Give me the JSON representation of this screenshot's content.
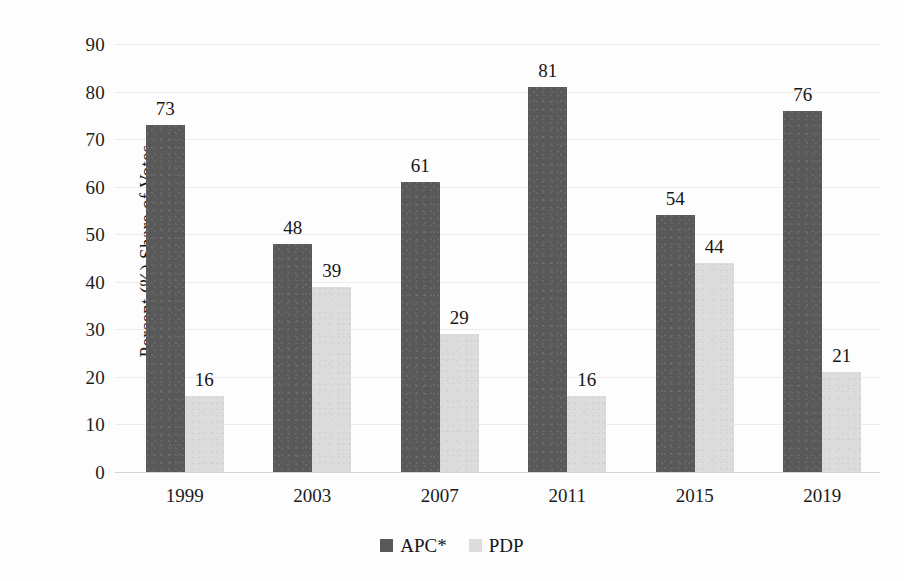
{
  "chart_data": {
    "type": "bar",
    "title": "",
    "xlabel": "",
    "ylabel": "Percent (%) Share of Votes",
    "ylim": [
      0,
      90
    ],
    "ytick_step": 10,
    "yticks": [
      "90",
      "80",
      "70",
      "60",
      "50",
      "40",
      "30",
      "20",
      "10",
      "0"
    ],
    "grid": true,
    "grid_axis": "y",
    "legend_position": "bottom-center",
    "categories": [
      "1999",
      "2003",
      "2007",
      "2011",
      "2015",
      "2019"
    ],
    "series": [
      {
        "name": "APC*",
        "color": "#595959",
        "values": [
          73,
          48,
          61,
          81,
          54,
          76
        ],
        "labels": [
          "73",
          "48",
          "61",
          "81",
          "54",
          "76"
        ]
      },
      {
        "name": "PDP",
        "color": "#dcdcdc",
        "values": [
          16,
          39,
          29,
          16,
          44,
          21
        ],
        "labels": [
          "16",
          "39",
          "29",
          "16",
          "44",
          "21"
        ]
      }
    ]
  },
  "axes": {
    "y_title": "Percent (%) Share of Votes",
    "y_ticks": [
      "90",
      "80",
      "70",
      "60",
      "50",
      "40",
      "30",
      "20",
      "10",
      "0"
    ],
    "x_ticks": [
      "1999",
      "2003",
      "2007",
      "2011",
      "2015",
      "2019"
    ]
  },
  "legend": {
    "items": [
      {
        "label": "APC*",
        "color": "#595959"
      },
      {
        "label": "PDP",
        "color": "#dcdcdc"
      }
    ]
  },
  "colors": {
    "apc": "#595959",
    "pdp": "#dcdcdc",
    "gridline": "#ececec",
    "baseline": "#d2d2d2",
    "background": "#fdfdfd",
    "text": "#1b1b1b"
  }
}
